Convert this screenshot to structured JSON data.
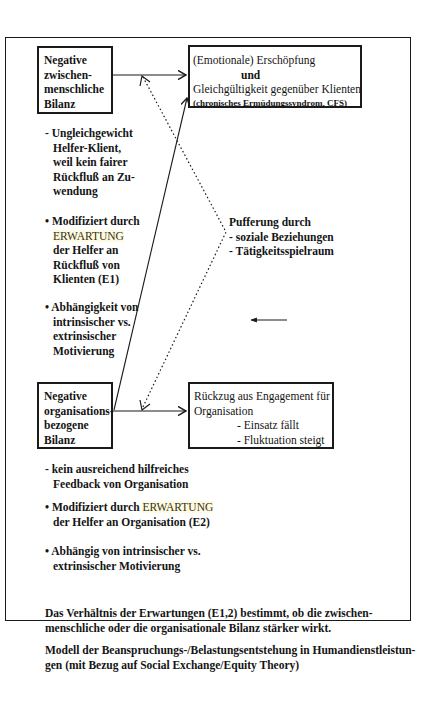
{
  "diagram": {
    "boxes": {
      "interpersonal": {
        "lines": [
          "Negative",
          "zwischen-",
          "menschliche",
          "Bilanz"
        ]
      },
      "exhaustion": {
        "line1": "(Emotionale) Erschöpfung",
        "line2": "und",
        "line3": "Gleichgültigkeit gegenüber Klienten",
        "line4": "(chronisches Ermüdungssyndrom, CFS)"
      },
      "organizational": {
        "lines": [
          "Negative",
          "organisations-",
          "bezogene",
          "Bilanz"
        ]
      },
      "withdrawal": {
        "line1": "Rückzug aus Engagement für",
        "line2": "Organisation",
        "line3": "- Einsatz fällt",
        "line4": "- Fluktuation steigt"
      }
    },
    "interpersonal_notes": {
      "imbalance": [
        "- Ungleichgewicht",
        "Helfer-Klient,",
        "weil kein fairer",
        "Rückfluß an Zu-",
        "wendung"
      ],
      "modified_prefix": "• Modifiziert durch",
      "modified_keyword": "ERWARTUNG",
      "modified_rest": [
        "der Helfer an",
        "Rückfluß von",
        "Klienten (E1)"
      ],
      "dependency": [
        "• Abhängigkeit von",
        "intrinsischer vs.",
        "extrinsischer",
        "Motivierung"
      ]
    },
    "buffering": {
      "title": "Pufferung durch",
      "items": [
        "- soziale Beziehungen",
        "- Tätigkeitsspielraum"
      ]
    },
    "organizational_notes": {
      "feedback": [
        "- kein ausreichend hilfreiches",
        "Feedback von Organisation"
      ],
      "modified_prefix": "• Modifiziert durch ",
      "modified_keyword": "ERWARTUNG",
      "modified_rest": "der Helfer an Organisation (E2)",
      "dependency": [
        "• Abhängig von intrinsischer vs.",
        "extrinsischer Motivierung"
      ]
    },
    "footer": {
      "ratio_line1": "Das Verhältnis der Erwartungen (E1,2) bestimmt, ob die zwischen-",
      "ratio_line2": "menschliche oder die organisationale Bilanz stärker wirkt.",
      "caption_line1": "Modell der Beanspruchungs-/Belastungsentstehung in Humandienstleistun-",
      "caption_line2": "gen (mit Bezug auf Social Exchange/Equity Theory)"
    },
    "colors": {
      "ink": "#1a1a1a",
      "highlight": "#fdfbe3"
    }
  }
}
